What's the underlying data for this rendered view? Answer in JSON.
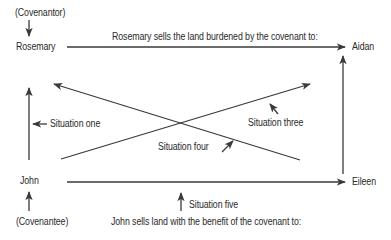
{
  "diagram": {
    "parties": {
      "covenantor_label": "(Covenantor)",
      "rosemary": "Rosemary",
      "aidan": "Aidan",
      "john": "John",
      "eileen": "Eileen",
      "covenantee_label": "(Covenantee)"
    },
    "captions": {
      "top": "Rosemary sells the land burdened by the covenant to:",
      "bottom": "John sells land with the benefit of the covenant to:"
    },
    "situations": {
      "one": "Situation one",
      "three": "Situation three",
      "four": "Situation four",
      "five": "Situation five"
    },
    "colors": {
      "line": "#3a3a3a",
      "text": "#2a2a2a",
      "background": "#ffffff"
    }
  }
}
